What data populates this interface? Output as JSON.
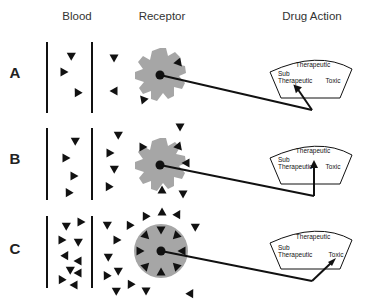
{
  "headers": {
    "blood": "Blood",
    "receptor": "Receptor",
    "drug_action": "Drug Action"
  },
  "rows": [
    {
      "label": "A",
      "needle_target": "Sub Therapeutic"
    },
    {
      "label": "B",
      "needle_target": "Therapeutic"
    },
    {
      "label": "C",
      "needle_target": "Toxic"
    }
  ],
  "dial": {
    "therapeutic": "Therapeutic",
    "sub": "Sub",
    "sub_therapeutic": "Therapeutic",
    "toxic": "Toxic"
  },
  "colors": {
    "receptor_fill": "#a6a6a6",
    "ink": "#111111"
  }
}
